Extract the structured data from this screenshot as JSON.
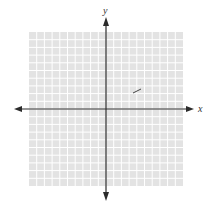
{
  "figure": {
    "type": "coordinate-plane",
    "x_axis_label": "x",
    "y_axis_label": "y",
    "grid": {
      "columns": 20,
      "rows": 20,
      "fill_color": "#e3e3e3",
      "line_color": "#ffffff"
    },
    "axis_color": "#2b2b2b",
    "mark": {
      "description": "short diagonal segment in quadrant I",
      "color": "#444444"
    }
  }
}
